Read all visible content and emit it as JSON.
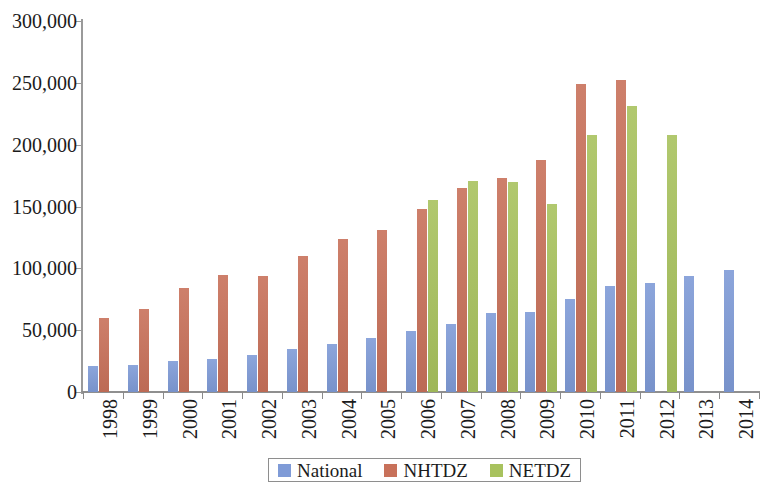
{
  "chart_data": {
    "type": "bar",
    "title": "",
    "subtitle": "",
    "xlabel": "",
    "ylabel": "",
    "ylim": [
      0,
      300000
    ],
    "ytick_labels": [
      "0",
      "50,000",
      "100,000",
      "150,000",
      "200,000",
      "250,000",
      "300,000"
    ],
    "ytick_values": [
      0,
      50000,
      100000,
      150000,
      200000,
      250000,
      300000
    ],
    "grid": false,
    "legend_position": "bottom",
    "categories": [
      "1998",
      "1999",
      "2000",
      "2001",
      "2002",
      "2003",
      "2004",
      "2005",
      "2006",
      "2007",
      "2008",
      "2009",
      "2010",
      "2011",
      "2012",
      "2013",
      "2014"
    ],
    "series": [
      {
        "name": "National",
        "color": "#7f9bd7",
        "values": [
          21000,
          22000,
          25000,
          27000,
          30000,
          35000,
          39000,
          44000,
          49000,
          55000,
          64000,
          65000,
          75000,
          86000,
          88000,
          94000,
          99000
        ]
      },
      {
        "name": "NHTDZ",
        "color": "#c8715a",
        "values": [
          60000,
          67000,
          84000,
          95000,
          94000,
          110000,
          124000,
          131000,
          148000,
          165000,
          173000,
          188000,
          249000,
          252000,
          null,
          null,
          null
        ]
      },
      {
        "name": "NETDZ",
        "color": "#a8c25e",
        "values": [
          null,
          null,
          null,
          null,
          null,
          null,
          null,
          null,
          155000,
          171000,
          170000,
          152000,
          208000,
          231000,
          208000,
          null,
          null
        ]
      }
    ]
  },
  "legend": {
    "items": [
      {
        "label": "National",
        "key": "national"
      },
      {
        "label": "NHTDZ",
        "key": "nhtdz"
      },
      {
        "label": "NETDZ",
        "key": "netdz"
      }
    ]
  }
}
